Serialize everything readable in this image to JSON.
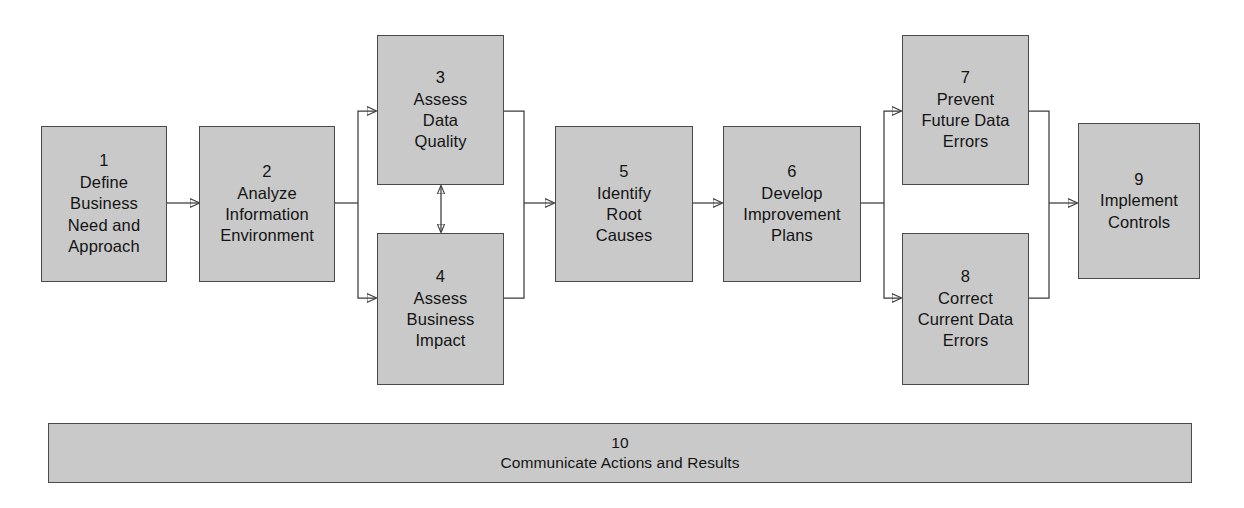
{
  "diagram": {
    "colors": {
      "node_fill": "#c9c9c9",
      "node_border": "#4a4a4a",
      "connector": "#3b3b3b",
      "text": "#141414",
      "background": "#ffffff"
    },
    "nodes": [
      {
        "id": "n1",
        "num": "1",
        "label": "Define\nBusiness\nNeed and\nApproach"
      },
      {
        "id": "n2",
        "num": "2",
        "label": "Analyze\nInformation\nEnvironment"
      },
      {
        "id": "n3",
        "num": "3",
        "label": "Assess\nData\nQuality"
      },
      {
        "id": "n4",
        "num": "4",
        "label": "Assess\nBusiness\nImpact"
      },
      {
        "id": "n5",
        "num": "5",
        "label": "Identify\nRoot\nCauses"
      },
      {
        "id": "n6",
        "num": "6",
        "label": "Develop\nImprovement\nPlans"
      },
      {
        "id": "n7",
        "num": "7",
        "label": "Prevent\nFuture Data\nErrors"
      },
      {
        "id": "n8",
        "num": "8",
        "label": "Correct\nCurrent Data\nErrors"
      },
      {
        "id": "n9",
        "num": "9",
        "label": "Implement\nControls"
      },
      {
        "id": "n10",
        "num": "10",
        "label": "Communicate Actions and Results"
      }
    ],
    "edges": [
      {
        "from": "1",
        "to": "2",
        "type": "arrow"
      },
      {
        "from": "2",
        "to": "3",
        "type": "split-arrow"
      },
      {
        "from": "2",
        "to": "4",
        "type": "split-arrow"
      },
      {
        "from": "3",
        "to": "4",
        "type": "double-arrow-vertical"
      },
      {
        "from": "3",
        "to": "5",
        "type": "merge-arrow"
      },
      {
        "from": "4",
        "to": "5",
        "type": "merge-arrow"
      },
      {
        "from": "5",
        "to": "6",
        "type": "arrow"
      },
      {
        "from": "6",
        "to": "7",
        "type": "split-arrow"
      },
      {
        "from": "6",
        "to": "8",
        "type": "split-arrow"
      },
      {
        "from": "7",
        "to": "9",
        "type": "merge-arrow"
      },
      {
        "from": "8",
        "to": "9",
        "type": "merge-arrow"
      }
    ]
  }
}
